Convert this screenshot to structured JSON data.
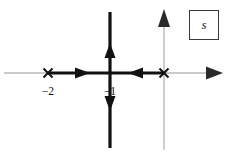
{
  "figure": {
    "plane_label": "s",
    "width": 230,
    "height": 156,
    "background_color": "#ffffff"
  },
  "colors": {
    "axis": "#b9b9b9",
    "axis_arrow": "#2a2a2a",
    "locus": "#111111",
    "text": "#111111",
    "box_border": "#3a3a3a"
  },
  "axes": {
    "real": {
      "name": "real-axis",
      "y": 73,
      "x_start": 4,
      "x_end": 224,
      "arrow_at": "right"
    },
    "imaginary": {
      "name": "imaginary-axis",
      "x": 164,
      "y_start": 10,
      "y_end": 150,
      "arrow_at": "top"
    }
  },
  "poles": [
    {
      "name": "pole-at-minus-2",
      "symbol": "×",
      "x": 48,
      "y": 73,
      "label": "−2",
      "label_x": 48,
      "label_y": 92
    },
    {
      "name": "pole-at-origin",
      "symbol": "×",
      "x": 164,
      "y": 73,
      "label": "",
      "label_x": 164,
      "label_y": 92
    }
  ],
  "labels": [
    {
      "name": "tick-label-minus-2",
      "text": "−2",
      "x": 48,
      "y": 92
    },
    {
      "name": "tick-label-minus-1",
      "text": "−1",
      "x": 110,
      "y": 92
    }
  ],
  "locus_branches": [
    {
      "name": "real-axis-branch-left",
      "type": "horizontal",
      "x_start": 48,
      "x_end": 110,
      "y": 73,
      "arrow_direction": "right",
      "arrow_x": 82
    },
    {
      "name": "real-axis-branch-right",
      "type": "horizontal",
      "x_start": 110,
      "x_end": 164,
      "y": 73,
      "arrow_direction": "left",
      "arrow_x": 136
    },
    {
      "name": "breakaway-branch-up",
      "type": "vertical",
      "x": 110,
      "y_start": 73,
      "y_end": 12,
      "arrow_direction": "up",
      "arrow_y": 45
    },
    {
      "name": "breakaway-branch-down",
      "type": "vertical",
      "x": 110,
      "y_start": 73,
      "y_end": 148,
      "arrow_direction": "down",
      "arrow_y": 110
    }
  ],
  "plane_box": {
    "name": "s-plane-label-box",
    "label": "s",
    "left": 189,
    "top": 10,
    "width": 30,
    "height": 30
  }
}
